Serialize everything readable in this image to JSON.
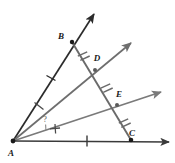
{
  "figure": {
    "background_color": "#ffffff"
  },
  "colors": {
    "ray_ab": "#2b2b2b",
    "ray_ad": "#6e6e6e",
    "ray_ae": "#7a7a7a",
    "ray_ac": "#4a4a4a",
    "transversal": "#6a6a6a",
    "label": "#1a1a1a",
    "point_fill": "#1a1a1a"
  },
  "points": {
    "A": {
      "label": "A",
      "x": 13,
      "y": 141,
      "label_x": 11,
      "label_y": 155
    },
    "B": {
      "label": "B",
      "x": 72,
      "y": 42,
      "label_x": 61,
      "label_y": 38
    },
    "D": {
      "label": "D",
      "x": 95,
      "y": 70,
      "label_x": 96,
      "label_y": 60
    },
    "E": {
      "label": "E",
      "x": 117,
      "y": 105,
      "label_x": 118,
      "label_y": 97
    },
    "C": {
      "label": "C",
      "x": 131,
      "y": 140,
      "label_x": 130,
      "label_y": 136
    }
  },
  "unknown_angle": {
    "label": "?",
    "x": 45,
    "y": 121
  },
  "rays": [
    {
      "name": "ray-AB",
      "from": "A",
      "through": "B",
      "tip_x": 94,
      "tip_y": 14,
      "color": "#2b2b2b",
      "width": 1.6
    },
    {
      "name": "ray-AD",
      "from": "A",
      "through": "D",
      "tip_x": 131,
      "tip_y": 43,
      "color": "#6e6e6e",
      "width": 1.6
    },
    {
      "name": "ray-AE",
      "from": "A",
      "through": "E",
      "tip_x": 161,
      "tip_y": 92,
      "color": "#7a7a7a",
      "width": 1.6
    },
    {
      "name": "ray-AC",
      "from": "A",
      "through": "C",
      "tip_x": 169,
      "tip_y": 142,
      "color": "#3a3a3a",
      "width": 1.5
    }
  ],
  "transversal": {
    "name": "segment-BC",
    "from": "B",
    "to": "C",
    "color": "#6a6a6a",
    "width": 1.8
  },
  "segment_ticks": {
    "ab_single_tick": {
      "count": 1,
      "x": 51,
      "y": 78
    },
    "ac_single_tick": {
      "count": 1,
      "x": 87,
      "y": 141
    },
    "bd_double_tick": {
      "count": 2,
      "x": 83,
      "y": 55
    },
    "de_double_tick": {
      "count": 2,
      "x": 106,
      "y": 87
    },
    "ec_double_tick": {
      "count": 2,
      "x": 124,
      "y": 122
    }
  },
  "angle_ticks": [
    {
      "name": "angle-tick-BAD",
      "x": 39,
      "y": 106
    },
    {
      "name": "angle-tick-EAC",
      "x": 55,
      "y": 129
    }
  ],
  "legend_note": ""
}
